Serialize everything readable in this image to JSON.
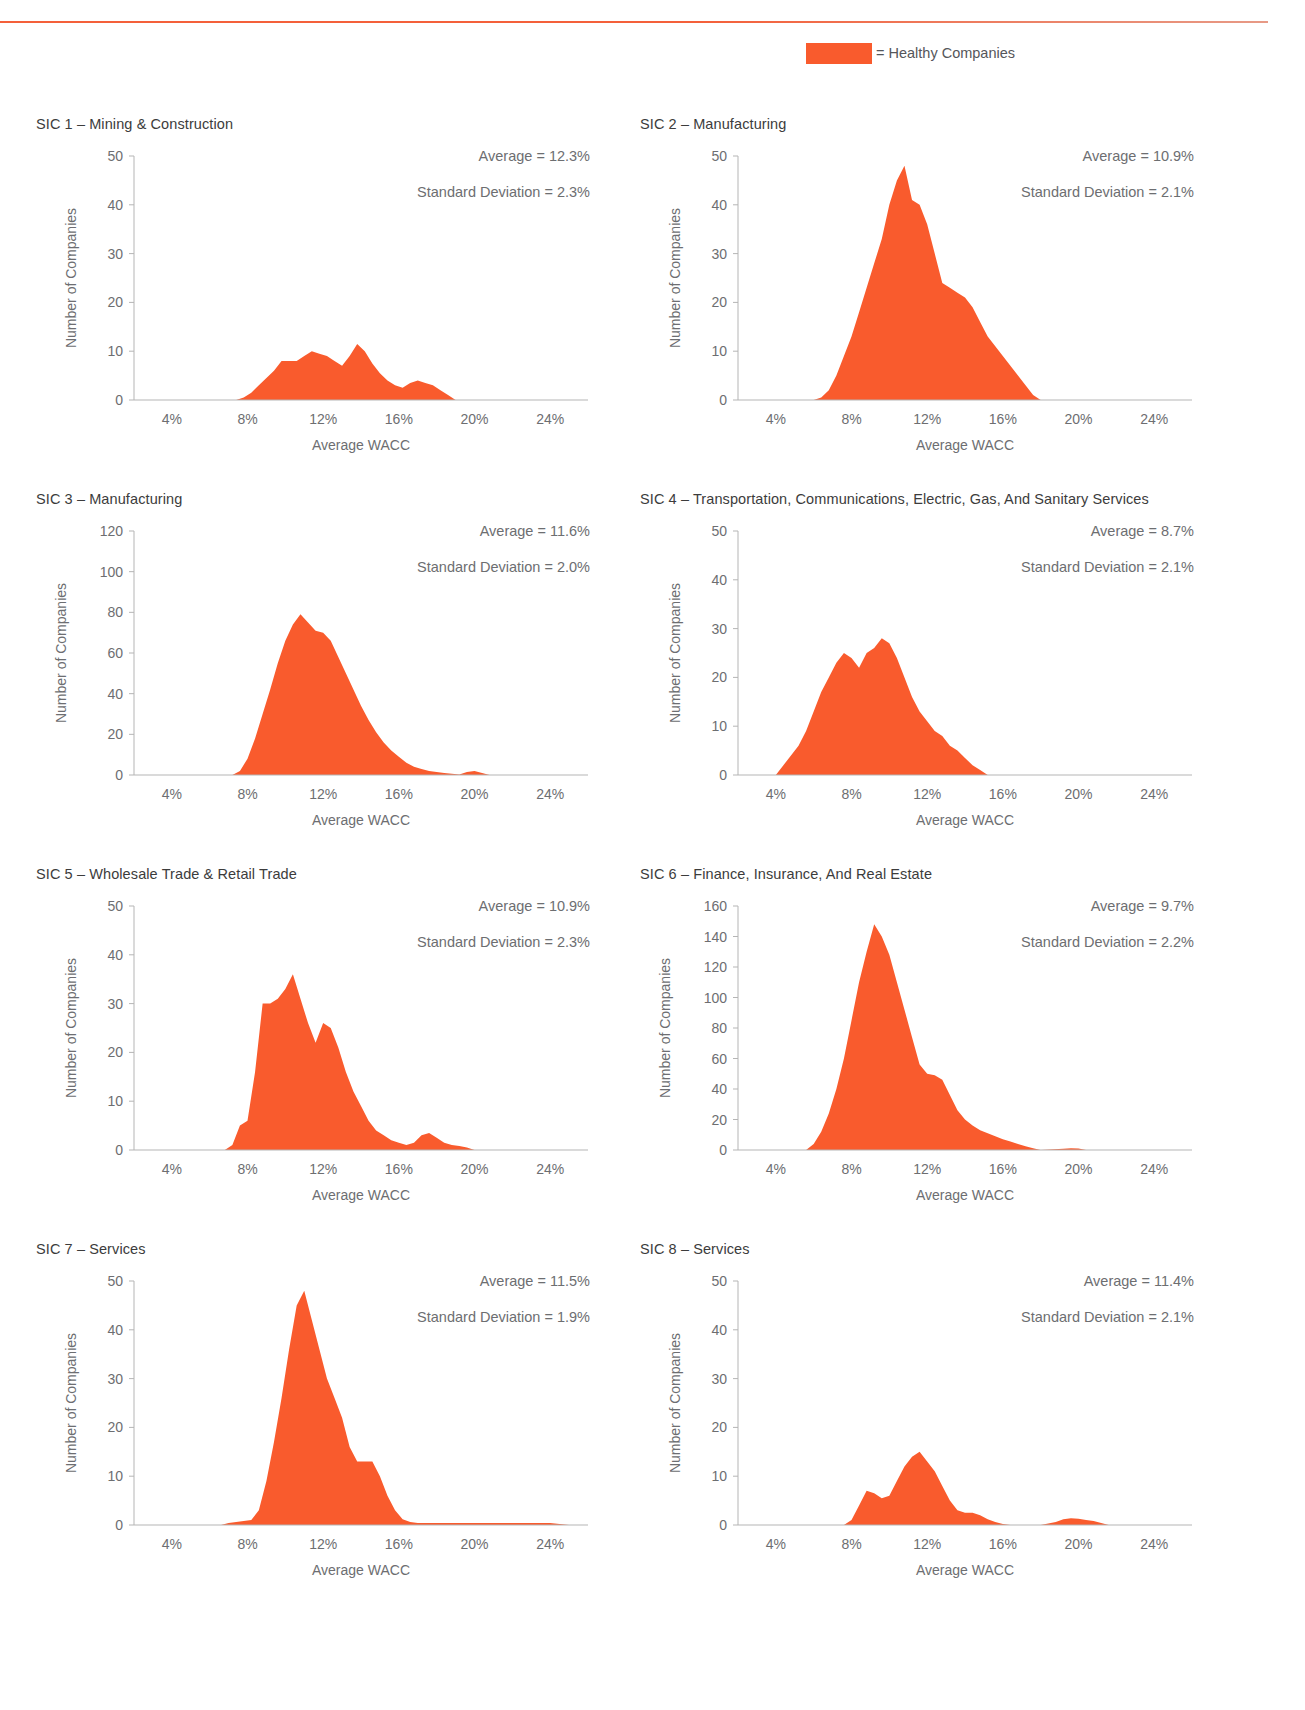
{
  "header": {
    "cropped_heading": "",
    "accent_color": "#f4603a"
  },
  "legend": {
    "label": "= Healthy Companies",
    "swatch_color": "#f95b2d"
  },
  "axis": {
    "xlabel": "Average WACC",
    "ylabel": "Number of Companies",
    "xticks": [
      "4%",
      "8%",
      "12%",
      "16%",
      "20%",
      "24%"
    ],
    "xtick_values": [
      4,
      8,
      12,
      16,
      20,
      24
    ],
    "xlim": [
      2,
      26
    ]
  },
  "chart_data": [
    {
      "type": "area",
      "id": "sic-1",
      "title": "SIC 1 – Mining & Construction",
      "average_label": "Average = 12.3%",
      "stdev_label": "Standard Deviation = 2.3%",
      "average": 12.3,
      "stdev": 2.3,
      "xlabel": "Average WACC",
      "ylabel": "Number of Companies",
      "ylim": [
        0,
        50
      ],
      "yticks": [
        0,
        10,
        20,
        30,
        40,
        50
      ],
      "x": [
        7.4,
        7.8,
        8.2,
        8.6,
        9.0,
        9.4,
        9.8,
        10.2,
        10.6,
        11.0,
        11.4,
        11.8,
        12.2,
        12.6,
        13.0,
        13.4,
        13.8,
        14.2,
        14.6,
        15.0,
        15.4,
        15.8,
        16.2,
        16.6,
        17.0,
        17.4,
        17.8,
        18.2,
        18.6,
        19.0
      ],
      "y": [
        0,
        0.5,
        1.5,
        3,
        4.5,
        6,
        8,
        8,
        8,
        9,
        10,
        9.5,
        9,
        8,
        7,
        9,
        11.5,
        10,
        7.5,
        5.5,
        4,
        3,
        2.5,
        3.5,
        4,
        3.5,
        3,
        2,
        1,
        0
      ]
    },
    {
      "type": "area",
      "id": "sic-2",
      "title": "SIC 2 – Manufacturing",
      "average_label": "Average = 10.9%",
      "stdev_label": "Standard Deviation = 2.1%",
      "average": 10.9,
      "stdev": 2.1,
      "xlabel": "Average WACC",
      "ylabel": "Number of Companies",
      "ylim": [
        0,
        50
      ],
      "yticks": [
        0,
        10,
        20,
        30,
        40,
        50
      ],
      "x": [
        6.0,
        6.4,
        6.8,
        7.2,
        7.6,
        8.0,
        8.4,
        8.8,
        9.2,
        9.6,
        10.0,
        10.4,
        10.8,
        11.2,
        11.6,
        12.0,
        12.4,
        12.8,
        13.2,
        13.6,
        14.0,
        14.4,
        14.8,
        15.2,
        15.6,
        16.0,
        16.4,
        16.8,
        17.2,
        17.6,
        18.0
      ],
      "y": [
        0,
        0.5,
        2,
        5,
        9,
        13,
        18,
        23,
        28,
        33,
        40,
        45,
        48,
        41,
        40,
        36,
        30,
        24,
        23,
        22,
        21,
        19,
        16,
        13,
        11,
        9,
        7,
        5,
        3,
        1,
        0
      ]
    },
    {
      "type": "area",
      "id": "sic-3",
      "title": "SIC 3 – Manufacturing",
      "average_label": "Average = 11.6%",
      "stdev_label": "Standard Deviation = 2.0%",
      "average": 11.6,
      "stdev": 2.0,
      "xlabel": "Average WACC",
      "ylabel": "Number of Companies",
      "ylim": [
        0,
        120
      ],
      "yticks": [
        0,
        20,
        40,
        60,
        80,
        100,
        120
      ],
      "x": [
        7.2,
        7.6,
        8.0,
        8.4,
        8.8,
        9.2,
        9.6,
        10.0,
        10.4,
        10.8,
        11.2,
        11.6,
        12.0,
        12.4,
        12.8,
        13.2,
        13.6,
        14.0,
        14.4,
        14.8,
        15.2,
        15.6,
        16.0,
        16.4,
        16.8,
        17.2,
        17.6,
        18.0,
        18.4,
        18.8,
        19.2,
        19.6,
        20.0,
        20.4,
        20.8
      ],
      "y": [
        0,
        2,
        8,
        18,
        30,
        42,
        55,
        66,
        74,
        79,
        75,
        71,
        70,
        66,
        58,
        50,
        42,
        34,
        27,
        21,
        16,
        12,
        9,
        6,
        4,
        3,
        2,
        1.5,
        1,
        0.6,
        0.3,
        1.5,
        2,
        1,
        0
      ]
    },
    {
      "type": "area",
      "id": "sic-4",
      "title": "SIC 4 – Transportation, Communications, Electric, Gas, And Sanitary Services",
      "average_label": "Average = 8.7%",
      "stdev_label": "Standard Deviation = 2.1%",
      "average": 8.7,
      "stdev": 2.1,
      "xlabel": "Average WACC",
      "ylabel": "Number of Companies",
      "ylim": [
        0,
        50
      ],
      "yticks": [
        0,
        10,
        20,
        30,
        40,
        50
      ],
      "x": [
        4.0,
        4.4,
        4.8,
        5.2,
        5.6,
        6.0,
        6.4,
        6.8,
        7.2,
        7.6,
        8.0,
        8.4,
        8.8,
        9.2,
        9.6,
        10.0,
        10.4,
        10.8,
        11.2,
        11.6,
        12.0,
        12.4,
        12.8,
        13.2,
        13.6,
        14.0,
        14.4,
        14.8,
        15.2
      ],
      "y": [
        0,
        2,
        4,
        6,
        9,
        13,
        17,
        20,
        23,
        25,
        24,
        22,
        25,
        26,
        28,
        27,
        24,
        20,
        16,
        13,
        11,
        9,
        8,
        6,
        5,
        3.5,
        2,
        1,
        0
      ]
    },
    {
      "type": "area",
      "id": "sic-5",
      "title": "SIC 5 – Wholesale Trade & Retail Trade",
      "average_label": "Average = 10.9%",
      "stdev_label": "Standard Deviation = 2.3%",
      "average": 10.9,
      "stdev": 2.3,
      "xlabel": "Average WACC",
      "ylabel": "Number of Companies",
      "ylim": [
        0,
        50
      ],
      "yticks": [
        0,
        10,
        20,
        30,
        40,
        50
      ],
      "x": [
        6.8,
        7.2,
        7.6,
        8.0,
        8.4,
        8.8,
        9.2,
        9.6,
        10.0,
        10.4,
        10.8,
        11.2,
        11.6,
        12.0,
        12.4,
        12.8,
        13.2,
        13.6,
        14.0,
        14.4,
        14.8,
        15.2,
        15.6,
        16.0,
        16.4,
        16.8,
        17.2,
        17.6,
        18.0,
        18.4,
        18.8,
        19.2,
        19.6,
        20.0
      ],
      "y": [
        0,
        1,
        5,
        6,
        16,
        30,
        30,
        31,
        33,
        36,
        31,
        26,
        22,
        26,
        25,
        21,
        16,
        12,
        9,
        6,
        4,
        3,
        2,
        1.5,
        1,
        1.5,
        3,
        3.5,
        2.5,
        1.5,
        1,
        0.8,
        0.5,
        0
      ]
    },
    {
      "type": "area",
      "id": "sic-6",
      "title": "SIC 6 – Finance, Insurance, And Real Estate",
      "average_label": "Average = 9.7%",
      "stdev_label": "Standard Deviation = 2.2%",
      "average": 9.7,
      "stdev": 2.2,
      "xlabel": "Average WACC",
      "ylabel": "Number of Companies",
      "ylim": [
        0,
        160
      ],
      "yticks": [
        0,
        20,
        40,
        60,
        80,
        100,
        120,
        140,
        160
      ],
      "x": [
        5.6,
        6.0,
        6.4,
        6.8,
        7.2,
        7.6,
        8.0,
        8.4,
        8.8,
        9.2,
        9.6,
        10.0,
        10.4,
        10.8,
        11.2,
        11.6,
        12.0,
        12.4,
        12.8,
        13.2,
        13.6,
        14.0,
        14.4,
        14.8,
        15.2,
        15.6,
        16.0,
        16.4,
        16.8,
        17.2,
        17.6,
        18.0,
        19.2,
        19.6,
        20.0,
        20.4
      ],
      "y": [
        0,
        4,
        12,
        24,
        40,
        60,
        85,
        110,
        130,
        148,
        140,
        128,
        110,
        92,
        74,
        56,
        50,
        49,
        46,
        36,
        26,
        20,
        16,
        13,
        11,
        9,
        7,
        5.5,
        4,
        2.5,
        1.2,
        0,
        0.8,
        1.2,
        1,
        0
      ]
    },
    {
      "type": "area",
      "id": "sic-7",
      "title": "SIC 7 – Services",
      "average_label": "Average = 11.5%",
      "stdev_label": "Standard Deviation = 1.9%",
      "average": 11.5,
      "stdev": 1.9,
      "xlabel": "Average WACC",
      "ylabel": "Number of Companies",
      "ylim": [
        0,
        50
      ],
      "yticks": [
        0,
        10,
        20,
        30,
        40,
        50
      ],
      "x": [
        6.6,
        7.0,
        7.4,
        7.8,
        8.2,
        8.6,
        9.0,
        9.4,
        9.8,
        10.2,
        10.6,
        11.0,
        11.4,
        11.8,
        12.2,
        12.6,
        13.0,
        13.4,
        13.8,
        14.2,
        14.6,
        15.0,
        15.4,
        15.8,
        16.2,
        16.6,
        17.0,
        18.0,
        19.0,
        20.0,
        21.0,
        22.0,
        23.0,
        24.0,
        25.0
      ],
      "y": [
        0,
        0.4,
        0.6,
        0.8,
        1,
        3,
        9,
        17,
        26,
        36,
        45,
        48,
        42,
        36,
        30,
        26,
        22,
        16,
        13,
        13,
        13,
        10,
        6,
        3,
        1.2,
        0.6,
        0.4,
        0.4,
        0.4,
        0.4,
        0.4,
        0.4,
        0.4,
        0.4,
        0
      ]
    },
    {
      "type": "area",
      "id": "sic-8",
      "title": "SIC 8 – Services",
      "average_label": "Average = 11.4%",
      "stdev_label": "Standard Deviation = 2.1%",
      "average": 11.4,
      "stdev": 2.1,
      "xlabel": "Average WACC",
      "ylabel": "Number of Companies",
      "ylim": [
        0,
        50
      ],
      "yticks": [
        0,
        10,
        20,
        30,
        40,
        50
      ],
      "x": [
        7.6,
        8.0,
        8.4,
        8.8,
        9.2,
        9.6,
        10.0,
        10.4,
        10.8,
        11.2,
        11.6,
        12.0,
        12.4,
        12.8,
        13.2,
        13.6,
        14.0,
        14.4,
        14.8,
        15.2,
        15.6,
        16.0,
        16.4,
        17.2,
        18.0,
        18.8,
        19.2,
        19.6,
        20.0,
        20.4,
        20.8,
        21.2,
        21.6
      ],
      "y": [
        0,
        1,
        4,
        7,
        6.5,
        5.5,
        6,
        9,
        12,
        14,
        15,
        13,
        11,
        8,
        5,
        3,
        2.5,
        2.5,
        2,
        1.2,
        0.6,
        0.2,
        0,
        0,
        0,
        0.6,
        1.2,
        1.4,
        1.3,
        1,
        0.8,
        0.4,
        0
      ]
    }
  ]
}
